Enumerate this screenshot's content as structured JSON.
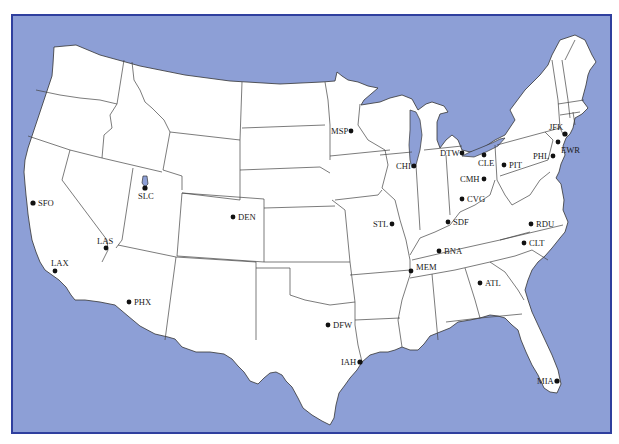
{
  "map": {
    "title": "",
    "background_color": "#8d9fd6",
    "frame_color": "#2f3f9e",
    "land_color": "#ffffff",
    "airports": [
      {
        "code": "SFO",
        "x": 33,
        "y": 203,
        "lx": 38,
        "ly": 206
      },
      {
        "code": "SLC",
        "x": 145,
        "y": 188,
        "lx": 138,
        "ly": 199
      },
      {
        "code": "DEN",
        "x": 233,
        "y": 217,
        "lx": 238,
        "ly": 220
      },
      {
        "code": "LAS",
        "x": 106,
        "y": 248,
        "lx": 97,
        "ly": 244
      },
      {
        "code": "LAX",
        "x": 55,
        "y": 271,
        "lx": 51,
        "ly": 267
      },
      {
        "code": "PHX",
        "x": 129,
        "y": 302,
        "lx": 134,
        "ly": 305
      },
      {
        "code": "MSP",
        "x": 351,
        "y": 131,
        "lx": 331,
        "ly": 134
      },
      {
        "code": "CHI",
        "x": 414,
        "y": 166,
        "lx": 396,
        "ly": 168
      },
      {
        "code": "DTW",
        "x": 462,
        "y": 153,
        "lx": 440,
        "ly": 156
      },
      {
        "code": "CLE",
        "x": 484,
        "y": 155,
        "lx": 478,
        "ly": 166
      },
      {
        "code": "PIT",
        "x": 504,
        "y": 165,
        "lx": 509,
        "ly": 168
      },
      {
        "code": "CMH",
        "x": 484,
        "y": 179,
        "lx": 460,
        "ly": 182
      },
      {
        "code": "CVG",
        "x": 462,
        "y": 199,
        "lx": 467,
        "ly": 202
      },
      {
        "code": "SDF",
        "x": 448,
        "y": 222,
        "lx": 453,
        "ly": 225
      },
      {
        "code": "STL",
        "x": 392,
        "y": 224,
        "lx": 373,
        "ly": 227
      },
      {
        "code": "BNA",
        "x": 439,
        "y": 251,
        "lx": 444,
        "ly": 254
      },
      {
        "code": "MEM",
        "x": 411,
        "y": 271,
        "lx": 416,
        "ly": 270
      },
      {
        "code": "RDU",
        "x": 531,
        "y": 224,
        "lx": 536,
        "ly": 227
      },
      {
        "code": "CLT",
        "x": 524,
        "y": 243,
        "lx": 529,
        "ly": 246
      },
      {
        "code": "ATL",
        "x": 480,
        "y": 283,
        "lx": 485,
        "ly": 286
      },
      {
        "code": "JFK",
        "x": 565,
        "y": 134,
        "lx": 549,
        "ly": 130
      },
      {
        "code": "EWR",
        "x": 558,
        "y": 142,
        "lx": 561,
        "ly": 153
      },
      {
        "code": "PHL",
        "x": 553,
        "y": 156,
        "lx": 533,
        "ly": 159
      },
      {
        "code": "DFW",
        "x": 328,
        "y": 325,
        "lx": 333,
        "ly": 328
      },
      {
        "code": "IAH",
        "x": 360,
        "y": 362,
        "lx": 341,
        "ly": 365
      },
      {
        "code": "MIA",
        "x": 557,
        "y": 381,
        "lx": 537,
        "ly": 384
      }
    ]
  }
}
